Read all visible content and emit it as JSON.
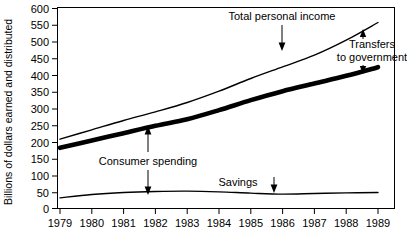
{
  "chart_data": {
    "type": "line",
    "title": "",
    "xlabel": "",
    "ylabel": "Billions of dollars earned and distributed",
    "x": [
      1979,
      1980,
      1981,
      1982,
      1983,
      1984,
      1985,
      1986,
      1987,
      1988,
      1989
    ],
    "categories": [
      "1979",
      "1980",
      "1981",
      "1982",
      "1983",
      "1984",
      "1985",
      "1986",
      "1987",
      "1988",
      "1989"
    ],
    "xlim": [
      1979,
      1989
    ],
    "ylim": [
      0,
      600
    ],
    "ytick_values": [
      0,
      50,
      100,
      150,
      200,
      250,
      300,
      350,
      400,
      450,
      500,
      550,
      600
    ],
    "ytick_labels": [
      "0",
      "50",
      "100",
      "150",
      "200",
      "250",
      "300",
      "350",
      "400",
      "450",
      "500",
      "550",
      "600"
    ],
    "grid": false,
    "legend": "none",
    "series": [
      {
        "name": "Total personal income",
        "style": "thin",
        "values": [
          208,
          236,
          264,
          290,
          318,
          352,
          390,
          425,
          460,
          505,
          558
        ]
      },
      {
        "name": "Consumer spending",
        "style": "thick",
        "values": [
          182,
          204,
          226,
          248,
          268,
          295,
          325,
          352,
          375,
          398,
          424
        ]
      },
      {
        "name": "Savings",
        "style": "thin",
        "values": [
          32,
          42,
          48,
          51,
          52,
          50,
          46,
          43,
          45,
          47,
          48
        ]
      }
    ],
    "annotations": [
      {
        "id": "total-personal-income",
        "label": "Total personal income",
        "text_x": 280,
        "text_y": 20,
        "arrow": "down",
        "arrow_x": 1986.0,
        "arrow_from": 430,
        "arrow_to": 380
      },
      {
        "id": "transfers-to-government",
        "label_line_1": "Transfers",
        "label_line_2": "to government",
        "arrow_up_x": 1988.4,
        "arrow_up_from": 448,
        "arrow_up_to": 492,
        "arrow_down_x": 1988.4,
        "arrow_down_from": 400,
        "arrow_down_to": 436
      },
      {
        "id": "consumer-spending",
        "label": "Consumer spending",
        "arrow_x": 1981.65,
        "arrow_top": 245,
        "arrow_bottom": 54,
        "arrow": "double"
      },
      {
        "id": "savings",
        "label": "Savings",
        "arrow": "down",
        "arrow_x": 1985.6,
        "arrow_from": 93,
        "arrow_to": 60
      }
    ]
  },
  "axis": {
    "y_title": "Billions of dollars earned and distributed",
    "y_ticks": [
      "600",
      "550",
      "500",
      "450",
      "400",
      "350",
      "300",
      "250",
      "200",
      "150",
      "100",
      "50",
      "0"
    ],
    "x_ticks": [
      "1979",
      "1980",
      "1981",
      "1982",
      "1983",
      "1984",
      "1985",
      "1986",
      "1987",
      "1988",
      "1989"
    ]
  },
  "labels": {
    "total_personal_income": "Total personal income",
    "transfers_line1": "Transfers",
    "transfers_line2": "to government",
    "consumer_spending": "Consumer spending",
    "savings": "Savings"
  },
  "colors": {
    "ink": "#000000",
    "background": "#ffffff"
  }
}
